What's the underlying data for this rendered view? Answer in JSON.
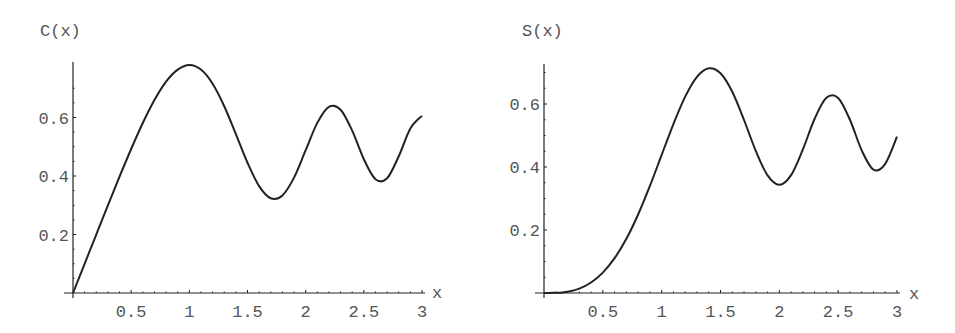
{
  "chart_data": [
    {
      "type": "line",
      "title": "",
      "ylabel": "C(x)",
      "xlabel": "x",
      "xlim": [
        0,
        3
      ],
      "ylim": [
        0,
        0.8
      ],
      "grid": false,
      "legend": null,
      "x_ticks": [
        "0.5",
        "1",
        "1.5",
        "2",
        "2.5",
        "3"
      ],
      "y_ticks": [
        "0.2",
        "0.4",
        "0.6"
      ],
      "x": [
        0,
        0.1,
        0.2,
        0.3,
        0.4,
        0.5,
        0.6,
        0.7,
        0.8,
        0.9,
        1.0,
        1.1,
        1.2,
        1.3,
        1.4,
        1.5,
        1.6,
        1.7,
        1.8,
        1.9,
        2.0,
        2.1,
        2.2,
        2.3,
        2.4,
        2.5,
        2.6,
        2.7,
        2.8,
        2.9,
        3.0
      ],
      "series": [
        {
          "name": "C(x)",
          "values": [
            0,
            0.0999,
            0.1999,
            0.2994,
            0.3975,
            0.4923,
            0.5811,
            0.6597,
            0.7228,
            0.7638,
            0.7799,
            0.7638,
            0.7154,
            0.6386,
            0.5431,
            0.4453,
            0.3655,
            0.3238,
            0.3336,
            0.3944,
            0.4882,
            0.5816,
            0.6363,
            0.6266,
            0.555,
            0.4574,
            0.389,
            0.3925,
            0.4675,
            0.5624,
            0.6058
          ]
        }
      ]
    },
    {
      "type": "line",
      "title": "",
      "ylabel": "S(x)",
      "xlabel": "x",
      "xlim": [
        0,
        3
      ],
      "ylim": [
        0,
        0.73
      ],
      "grid": false,
      "legend": null,
      "x_ticks": [
        "0.5",
        "1",
        "1.5",
        "2",
        "2.5",
        "3"
      ],
      "y_ticks": [
        "0.2",
        "0.4",
        "0.6"
      ],
      "x": [
        0,
        0.1,
        0.2,
        0.3,
        0.4,
        0.5,
        0.6,
        0.7,
        0.8,
        0.9,
        1.0,
        1.1,
        1.2,
        1.3,
        1.4,
        1.5,
        1.6,
        1.7,
        1.8,
        1.9,
        2.0,
        2.1,
        2.2,
        2.3,
        2.4,
        2.5,
        2.6,
        2.7,
        2.8,
        2.9,
        3.0
      ],
      "series": [
        {
          "name": "S(x)",
          "values": [
            0,
            0.0005,
            0.0042,
            0.0141,
            0.0334,
            0.0647,
            0.1105,
            0.1721,
            0.2493,
            0.3398,
            0.4383,
            0.5365,
            0.6234,
            0.6863,
            0.7135,
            0.6975,
            0.6389,
            0.5492,
            0.4509,
            0.3733,
            0.3434,
            0.3743,
            0.4557,
            0.5532,
            0.6197,
            0.6192,
            0.55,
            0.4529,
            0.3915,
            0.4101,
            0.4963
          ]
        }
      ]
    }
  ],
  "charts": {
    "left": {
      "ylabel": "C(x)",
      "xlabel": "x"
    },
    "right": {
      "ylabel": "S(x)",
      "xlabel": "x"
    }
  }
}
